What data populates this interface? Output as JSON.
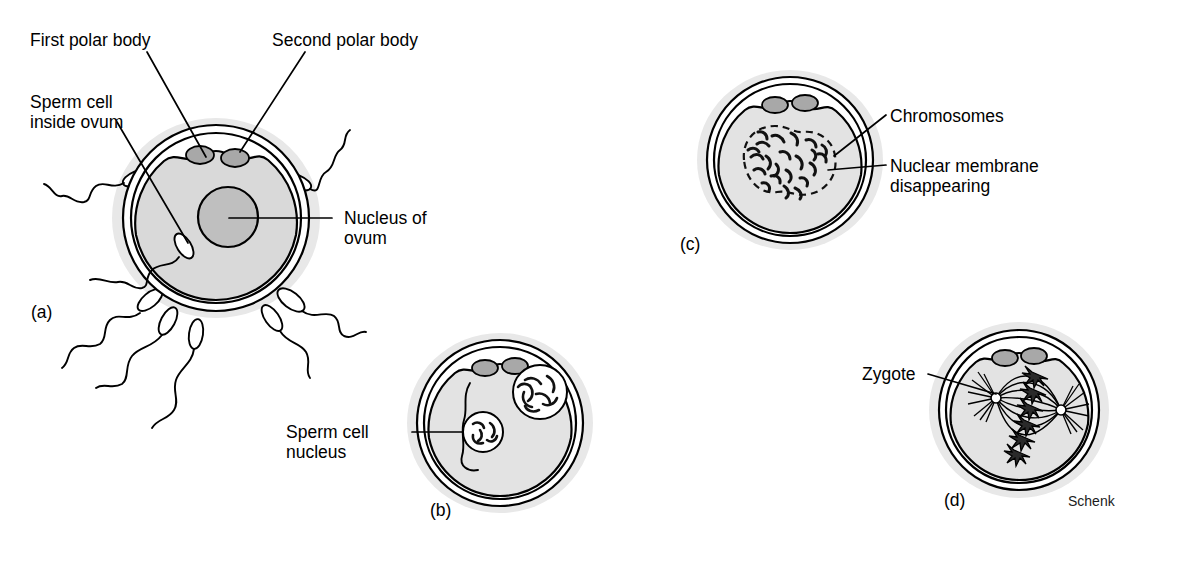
{
  "figure": {
    "credit": "Schenk",
    "background_color": "#ffffff",
    "ink_color": "#000000",
    "halo_color": "#e8e8e8",
    "cytoplasm_color": "#d9d9d9",
    "nucleus_color": "#bfbfbf",
    "polar_body_color": "#a8a8a8"
  },
  "panels": [
    {
      "id": "a",
      "label": "(a)",
      "caption": "Sperm cells surrounding ovum; one sperm cell has penetrated the zona pellucida",
      "labels": [
        {
          "id": "first-polar-body",
          "text": "First polar body",
          "lines": [
            "First polar body"
          ]
        },
        {
          "id": "second-polar-body",
          "text": "Second polar body",
          "lines": [
            "Second polar body"
          ]
        },
        {
          "id": "sperm-cell-inside-ovum",
          "text": "Sperm cell inside ovum",
          "lines": [
            "Sperm cell",
            "inside ovum"
          ]
        },
        {
          "id": "nucleus-of-ovum",
          "text": "Nucleus of ovum",
          "lines": [
            "Nucleus of",
            "ovum"
          ]
        }
      ],
      "structures": [
        "zona pellucida",
        "cytoplasm",
        "first polar body",
        "second polar body",
        "ovum nucleus",
        "sperm cells",
        "sperm tails"
      ],
      "sperm_count": 7
    },
    {
      "id": "b",
      "label": "(b)",
      "caption": "Sperm cell nucleus and ovum nucleus inside the ovum",
      "labels": [
        {
          "id": "sperm-cell-nucleus",
          "text": "Sperm cell nucleus",
          "lines": [
            "Sperm cell",
            "nucleus"
          ]
        }
      ],
      "structures": [
        "zona pellucida",
        "cytoplasm",
        "two polar bodies",
        "ovum nucleus",
        "sperm cell nucleus",
        "sperm tail"
      ]
    },
    {
      "id": "c",
      "label": "(c)",
      "caption": "Nuclear membranes break down and chromosomes intermingle",
      "labels": [
        {
          "id": "chromosomes",
          "text": "Chromosomes",
          "lines": [
            "Chromosomes"
          ]
        },
        {
          "id": "nuclear-membrane-disappearing",
          "text": "Nuclear membrane disappearing",
          "lines": [
            "Nuclear membrane",
            "disappearing"
          ]
        }
      ],
      "structures": [
        "zona pellucida",
        "cytoplasm",
        "two polar bodies",
        "dissolving nuclear membrane",
        "chromosomes"
      ]
    },
    {
      "id": "d",
      "label": "(d)",
      "caption": "Zygote with mitotic spindle and chromosomes aligned at the equator",
      "labels": [
        {
          "id": "zygote",
          "text": "Zygote",
          "lines": [
            "Zygote"
          ]
        }
      ],
      "structures": [
        "zona pellucida",
        "cytoplasm",
        "two polar bodies",
        "mitotic spindle",
        "centrosomes",
        "chromosomes"
      ]
    }
  ]
}
